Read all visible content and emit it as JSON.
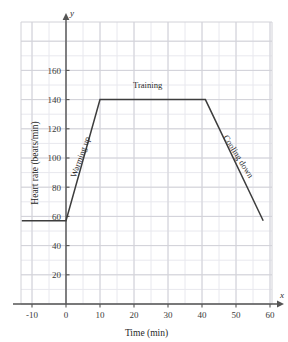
{
  "chart_data": {
    "type": "line",
    "title": "",
    "xlabel": "Time (min)",
    "ylabel": "Heart rate (beats/min)",
    "x_axis_name": "x",
    "y_axis_name": "y",
    "xlim": [
      -13,
      62
    ],
    "ylim": [
      0,
      172
    ],
    "xticks": [
      "-10",
      "0",
      "10",
      "20",
      "30",
      "40",
      "50",
      "60"
    ],
    "xtick_values": [
      -10,
      0,
      10,
      20,
      30,
      40,
      50,
      60
    ],
    "yticks": [
      "20",
      "40",
      "60",
      "80",
      "100",
      "120",
      "140",
      "160"
    ],
    "ytick_values": [
      20,
      40,
      60,
      80,
      100,
      120,
      140,
      160
    ],
    "grid": true,
    "grid_major_step_x": 10,
    "grid_minor_step_x": 5,
    "grid_major_step_y": 20,
    "grid_minor_step_y": 10,
    "legend": "none",
    "series": [
      {
        "name": "Heart rate",
        "x": [
          -13,
          0,
          10,
          41,
          58
        ],
        "values": [
          57,
          57,
          140,
          140,
          57
        ]
      }
    ],
    "annotations": [
      {
        "id": "warming-up",
        "text": "Warming up",
        "x": 5,
        "y": 100,
        "rotation": -70
      },
      {
        "id": "training",
        "text": "Training",
        "x": 24,
        "y": 148,
        "rotation": 0
      },
      {
        "id": "cooling-down",
        "text": "Cooling down",
        "x": 50,
        "y": 100,
        "rotation": 58
      }
    ],
    "colors": {
      "line": "#3d3d3d",
      "axis": "#555555",
      "grid_major": "#d2d2d8",
      "grid_minor": "#e8e8ee",
      "text": "#2b2b2b",
      "background": "#ffffff"
    }
  }
}
